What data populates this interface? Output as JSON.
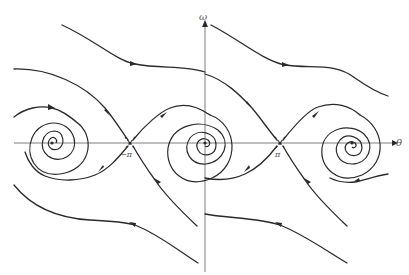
{
  "diagram": {
    "type": "phase-portrait",
    "axes": {
      "horizontal_label": "θ",
      "vertical_label": "ω"
    },
    "tick_labels": {
      "neg_pi": "−π",
      "pi": "π"
    },
    "fixed_points": [
      {
        "kind": "stable-spiral",
        "theta": "−2π",
        "px": [
          52,
          143
        ]
      },
      {
        "kind": "saddle",
        "theta": "−π",
        "px": [
          130,
          143
        ]
      },
      {
        "kind": "stable-spiral",
        "theta": "0",
        "px": [
          205,
          143
        ]
      },
      {
        "kind": "saddle",
        "theta": "π",
        "px": [
          280,
          143
        ]
      },
      {
        "kind": "stable-spiral",
        "theta": "2π",
        "px": [
          352,
          143
        ]
      }
    ],
    "colors": {
      "curve": "#2a2a2a",
      "axis": "#6e6e6e",
      "label": "#555555",
      "background": "#ffffff"
    }
  }
}
